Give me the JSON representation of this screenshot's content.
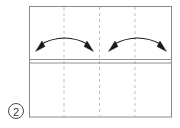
{
  "diagram": {
    "step_label": "2",
    "step_badge_name": "circled-step-number",
    "canvas": {
      "width": 180,
      "height": 128
    },
    "colors": {
      "paper_fill": "#ffffff",
      "paper_edge": "#8a8a8a",
      "crease_line": "#b8b8b8",
      "fold_edge": "#8f8f8f",
      "arrow": "#1a1a1a",
      "badge_stroke": "#4a4a4a",
      "badge_text": "#3a3a3a",
      "background": "#ffffff"
    },
    "paper": {
      "left": 29,
      "right": 172,
      "top": 6,
      "bottom": 117,
      "label": "square sheet, front view"
    },
    "fold_edge": {
      "label": "horizontal folded edge",
      "y_outer": 59.5,
      "y_inner": 63.0
    },
    "crease_lines": [
      {
        "name": "crease-line-1",
        "x": 64,
        "style": "dashed",
        "label": "vertical crease left"
      },
      {
        "name": "crease-line-2",
        "x": 99.5,
        "style": "dashed",
        "label": "vertical crease center"
      },
      {
        "name": "crease-line-3",
        "x": 135,
        "style": "dashed",
        "label": "vertical crease right"
      }
    ],
    "arrows": [
      {
        "name": "double-arrow-left",
        "label": "fold inward arrow left pair",
        "type": "double-headed-arc",
        "start": {
          "x": 39,
          "y": 47
        },
        "end": {
          "x": 90,
          "y": 47
        },
        "apex": {
          "x": 64.5,
          "y": 35
        }
      },
      {
        "name": "double-arrow-right",
        "label": "fold inward arrow right pair",
        "type": "double-headed-arc",
        "start": {
          "x": 112,
          "y": 47
        },
        "end": {
          "x": 163,
          "y": 47
        },
        "apex": {
          "x": 137.5,
          "y": 35
        }
      }
    ],
    "badge": {
      "center": {
        "x": 16,
        "y": 111
      },
      "radius": 7.5
    }
  }
}
